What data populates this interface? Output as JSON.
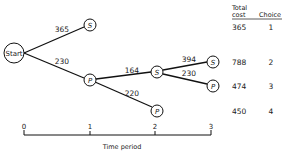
{
  "tree": {
    "start_label": "Start",
    "nodes": {
      "s1": "S",
      "p1": "P",
      "s2": "S",
      "s3": "S",
      "p3": "P",
      "p2": "P"
    },
    "edges": {
      "start_s1": "365",
      "start_p1": "230",
      "p1_s2": "164",
      "p1_p2": "220",
      "s2_s3": "394",
      "s2_p3": "230"
    }
  },
  "table": {
    "header_total": "Total",
    "header_cost": "cost",
    "header_choice": "Choice",
    "rows": [
      {
        "cost": "365",
        "choice": "1"
      },
      {
        "cost": "788",
        "choice": "2"
      },
      {
        "cost": "474",
        "choice": "3"
      },
      {
        "cost": "450",
        "choice": "4"
      }
    ]
  },
  "axis": {
    "ticks": [
      "0",
      "1",
      "2",
      "3"
    ],
    "label": "Time period"
  }
}
